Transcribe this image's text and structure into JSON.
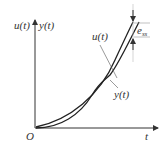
{
  "diagram": {
    "y_axis_label_u": "u(t)",
    "y_axis_label_y": "y(t)",
    "x_axis_label": "t",
    "origin_label": "O",
    "curve_u_label": "u(t)",
    "curve_y_label": "y(t)",
    "error_label": "e",
    "error_subscript": "ss"
  }
}
